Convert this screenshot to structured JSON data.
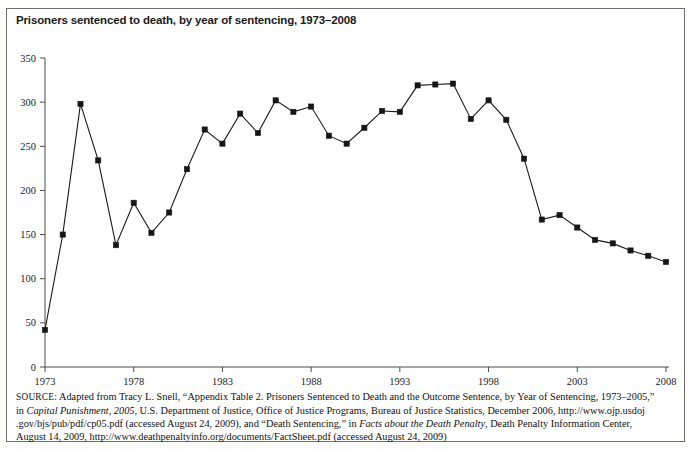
{
  "figure": {
    "title": "Prisoners sentenced to death, by year of sentencing, 1973–2008",
    "source_prefix": "SOURCE:",
    "source_line_1": "Adapted from Tracy L. Snell, “Appendix Table 2. Prisoners Sentenced to Death and the Outcome Sentence, by Year of Sentencing, 1973–2005,”",
    "source_line_2_a": "in ",
    "source_line_2_italic": "Capital Punishment, 2005,",
    "source_line_2_b": " U.S. Department of Justice, Office of Justice Programs, Bureau of Justice Statistics, December 2006, http://www.ojp.usdoj",
    "source_line_3_a": ".gov/bjs/pub/pdf/cp05.pdf (accessed August 24, 2009), and “Death Sentencing,” in ",
    "source_line_3_italic": "Facts about the Death Penalty",
    "source_line_3_b": ", Death Penalty Information Center,",
    "source_line_4": "August 14, 2009, http://www.deathpenaltyinfo.org/documents/FactSheet.pdf (accessed August 24, 2009)"
  },
  "chart_data": {
    "type": "line",
    "title": "Prisoners sentenced to death, by year of sentencing, 1973–2008",
    "xlabel": "",
    "ylabel": "",
    "xlim": [
      1973,
      2008
    ],
    "ylim": [
      0,
      350
    ],
    "ytick_step": 50,
    "yticks": [
      0,
      50,
      100,
      150,
      200,
      250,
      300,
      350
    ],
    "ytick_labels": [
      "0",
      "50",
      "100",
      "150",
      "200",
      "250",
      "300",
      "350"
    ],
    "xticks": [
      1973,
      1978,
      1983,
      1988,
      1993,
      1998,
      2003,
      2008
    ],
    "xtick_labels": [
      "1973",
      "1978",
      "1983",
      "1988",
      "1993",
      "1998",
      "2003",
      "2008"
    ],
    "grid": false,
    "legend": null,
    "marker": "square",
    "marker_color": "#161616",
    "line_color": "#1a1a1a",
    "x": [
      1973,
      1974,
      1975,
      1976,
      1977,
      1978,
      1979,
      1980,
      1981,
      1982,
      1983,
      1984,
      1985,
      1986,
      1987,
      1988,
      1989,
      1990,
      1991,
      1992,
      1993,
      1994,
      1995,
      1996,
      1997,
      1998,
      1999,
      2000,
      2001,
      2002,
      2003,
      2004,
      2005,
      2006,
      2007,
      2008
    ],
    "values": [
      42,
      150,
      298,
      234,
      138,
      186,
      152,
      175,
      224,
      269,
      253,
      287,
      265,
      302,
      289,
      295,
      262,
      253,
      271,
      290,
      289,
      319,
      320,
      321,
      281,
      302,
      280,
      236,
      167,
      172,
      158,
      144,
      140,
      132,
      126,
      119
    ],
    "series": [
      {
        "name": "Prisoners sentenced to death",
        "values": [
          42,
          150,
          298,
          234,
          138,
          186,
          152,
          175,
          224,
          269,
          253,
          287,
          265,
          302,
          289,
          295,
          262,
          253,
          271,
          290,
          289,
          319,
          320,
          321,
          281,
          302,
          280,
          236,
          167,
          172,
          158,
          144,
          140,
          132,
          126,
          119
        ]
      }
    ]
  }
}
